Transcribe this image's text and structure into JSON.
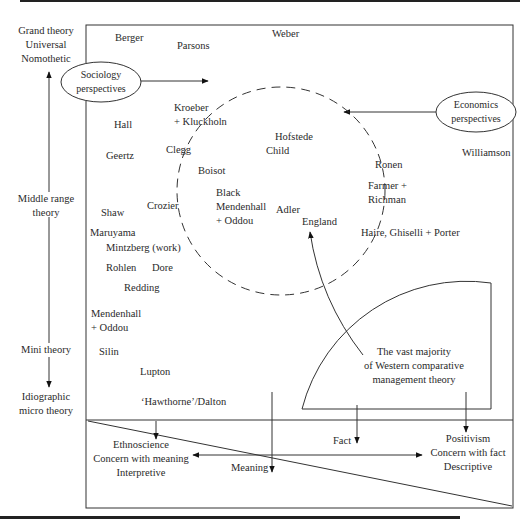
{
  "axis": {
    "top": [
      "Grand theory",
      "Universal",
      "Nomothetic"
    ],
    "middle": [
      "Middle range",
      "theory"
    ],
    "mini": "Mini theory",
    "bottom": [
      "Idiographic",
      "micro theory"
    ]
  },
  "bubbles": {
    "sociology": [
      "Sociology",
      "perspectives"
    ],
    "economics": [
      "Economics",
      "perspectives"
    ]
  },
  "authors": {
    "berger": "Berger",
    "parsons": "Parsons",
    "weber": "Weber",
    "kroeber": [
      "Kroeber",
      "+ Kluckholn"
    ],
    "hall": "Hall",
    "hofstede": "Hofstede",
    "child": "Child",
    "clegg": "Clegg",
    "geertz": "Geertz",
    "boisot": "Boisot",
    "ronen": "Ronen",
    "williamson": "Williamson",
    "farmer": [
      "Farmer +",
      "Richman"
    ],
    "black": [
      "Black",
      "Mendenhall",
      "+ Oddou"
    ],
    "adler": "Adler",
    "england": "England",
    "crozier": "Crozier",
    "shaw": "Shaw",
    "haire": "Haire, Ghiselli + Porter",
    "maruyama": "Maruyama",
    "mintzberg": "Mintzberg (work)",
    "rohlen": "Rohlen",
    "dore": "Dore",
    "redding": "Redding",
    "mendenhall2": [
      "Mendenhall",
      "+ Oddou"
    ],
    "silin": "Silin",
    "lupton": "Lupton",
    "hawthorne": "‘Hawthorne’/Dalton"
  },
  "callout": [
    "The vast majority",
    "of Western comparative",
    "management theory"
  ],
  "bottom_panel": {
    "left": [
      "Ethnoscience",
      "Concern with meaning",
      "Interpretive"
    ],
    "right": [
      "Positivism",
      "Concern with fact",
      "Descriptive"
    ],
    "meaning": "Meaning",
    "fact": "Fact"
  }
}
